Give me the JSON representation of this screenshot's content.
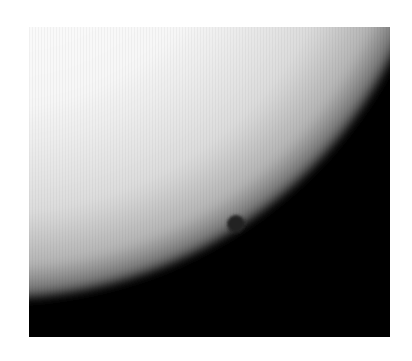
{
  "image": {
    "subject": "Planetary transit across the solar limb",
    "alt": "Grayscale photograph of the Sun's edge with a small dark planet disk silhouetted near the limb",
    "colors": {
      "background_page": "#ffffff",
      "sky": "#000000",
      "sun_center": "#ffffff",
      "sun_limb": "#2a2a2a",
      "planet_disk": "#1e1e1e"
    }
  }
}
